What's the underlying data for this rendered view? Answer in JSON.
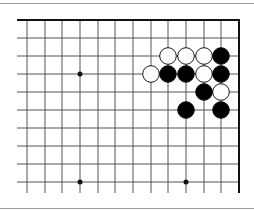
{
  "diagram": {
    "type": "go-board-fragment",
    "corner": "top-right",
    "columns_visible": 13,
    "rows_visible": 10,
    "grid": {
      "x": [
        27,
        45,
        62,
        80,
        98,
        115,
        133,
        151,
        168,
        186,
        204,
        221,
        239
      ],
      "y": [
        20,
        38,
        56,
        74,
        92,
        110,
        128,
        146,
        164,
        182
      ]
    },
    "star_points": [
      {
        "col": 3,
        "row": 3
      },
      {
        "col": 3,
        "row": 9
      },
      {
        "col": 9,
        "row": 9
      }
    ],
    "stones": [
      {
        "color": "white",
        "col": 8,
        "row": 2
      },
      {
        "color": "white",
        "col": 9,
        "row": 2
      },
      {
        "color": "white",
        "col": 10,
        "row": 2
      },
      {
        "color": "black",
        "col": 11,
        "row": 2
      },
      {
        "color": "white",
        "col": 7,
        "row": 3
      },
      {
        "color": "black",
        "col": 8,
        "row": 3
      },
      {
        "color": "black",
        "col": 9,
        "row": 3
      },
      {
        "color": "white",
        "col": 10,
        "row": 3
      },
      {
        "color": "black",
        "col": 11,
        "row": 3
      },
      {
        "color": "black",
        "col": 10,
        "row": 4
      },
      {
        "color": "white",
        "col": 11,
        "row": 4
      },
      {
        "color": "black",
        "col": 9,
        "row": 5
      },
      {
        "color": "black",
        "col": 11,
        "row": 5
      }
    ],
    "colors": {
      "line": "#555555",
      "edge": "#111111",
      "black_stone": "#000000",
      "white_stone": "#ffffff",
      "separator": "#9a9a9a"
    }
  }
}
